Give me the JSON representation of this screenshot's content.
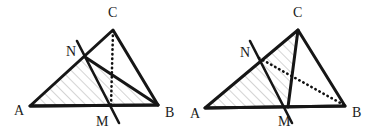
{
  "figure": {
    "background_color": "#ffffff",
    "stroke_color": "#161616",
    "dotted_color": "#111111",
    "hatch_color": "#9a9a9a",
    "hatch_bg": "#fbfbfb",
    "panels": [
      {
        "id": "left-figure",
        "name": "left-triangle-figure",
        "shaded_region": "ANB",
        "dotted_segment": "C-M",
        "points": {
          "A": {
            "label": "A",
            "x": 30,
            "y": 106,
            "label_x": 14,
            "label_y": 115
          },
          "B": {
            "label": "B",
            "x": 158,
            "y": 105,
            "label_x": 165,
            "label_y": 117
          },
          "C": {
            "label": "C",
            "x": 113,
            "y": 30,
            "label_x": 108,
            "label_y": 17
          },
          "M": {
            "label": "M",
            "x": 111,
            "y": 106,
            "label_x": 96,
            "label_y": 126
          },
          "N": {
            "label": "N",
            "x": 85,
            "y": 57,
            "label_x": 66,
            "label_y": 56
          }
        },
        "transversal": {
          "from_x": 77,
          "from_y": 41,
          "to_x": 119,
          "to_y": 123
        }
      },
      {
        "id": "right-figure",
        "name": "right-triangle-figure",
        "shaded_region": "ACM",
        "dotted_segment": "N-B",
        "points": {
          "A": {
            "label": "A",
            "x": 205,
            "y": 108,
            "label_x": 190,
            "label_y": 118
          },
          "B": {
            "label": "B",
            "x": 345,
            "y": 106,
            "label_x": 352,
            "label_y": 117
          },
          "C": {
            "label": "C",
            "x": 298,
            "y": 30,
            "label_x": 293,
            "label_y": 17
          },
          "M": {
            "label": "M",
            "x": 288,
            "y": 107,
            "label_x": 278,
            "label_y": 126
          },
          "N": {
            "label": "N",
            "x": 258,
            "y": 57,
            "label_x": 240,
            "label_y": 57
          }
        },
        "transversal": {
          "from_x": 250,
          "from_y": 41,
          "to_x": 292,
          "to_y": 123
        }
      }
    ]
  }
}
